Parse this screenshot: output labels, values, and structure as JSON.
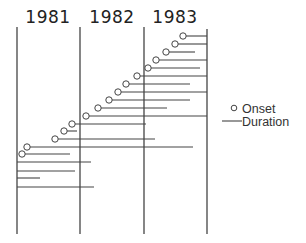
{
  "chart_data": {
    "type": "timeline",
    "title": "",
    "years": [
      "1981",
      "1982",
      "1983"
    ],
    "x_axis": {
      "unit": "year",
      "range": [
        1981.0,
        1984.0
      ],
      "boundaries": [
        1981,
        1982,
        1983,
        1984
      ],
      "pixel_boundaries": [
        17,
        80,
        144,
        207
      ]
    },
    "grid": false,
    "legend": {
      "position": "right",
      "entries": [
        {
          "symbol": "circle",
          "label": "Onset"
        },
        {
          "symbol": "line",
          "label": "Duration"
        }
      ]
    },
    "rows": [
      {
        "y": 36,
        "onset_px": 183,
        "end_px": 207,
        "has_onset": true
      },
      {
        "y": 44,
        "onset_px": 175,
        "end_px": 207,
        "has_onset": true
      },
      {
        "y": 52,
        "onset_px": 166,
        "end_px": 195,
        "has_onset": true
      },
      {
        "y": 60,
        "onset_px": 156,
        "end_px": 207,
        "has_onset": true
      },
      {
        "y": 68,
        "onset_px": 148,
        "end_px": 200,
        "has_onset": true
      },
      {
        "y": 76,
        "onset_px": 137,
        "end_px": 207,
        "has_onset": true
      },
      {
        "y": 84,
        "onset_px": 126,
        "end_px": 190,
        "has_onset": true
      },
      {
        "y": 92,
        "onset_px": 118,
        "end_px": 207,
        "has_onset": true
      },
      {
        "y": 100,
        "onset_px": 109,
        "end_px": 190,
        "has_onset": true
      },
      {
        "y": 108,
        "onset_px": 98,
        "end_px": 167,
        "has_onset": true
      },
      {
        "y": 116,
        "onset_px": 86,
        "end_px": 207,
        "has_onset": true
      },
      {
        "y": 124,
        "onset_px": 72,
        "end_px": 146,
        "has_onset": true
      },
      {
        "y": 131,
        "onset_px": 64,
        "end_px": 77,
        "has_onset": true
      },
      {
        "y": 139,
        "onset_px": 55,
        "end_px": 155,
        "has_onset": true
      },
      {
        "y": 147,
        "onset_px": 27,
        "end_px": 193,
        "has_onset": true
      },
      {
        "y": 154,
        "onset_px": 22,
        "end_px": 70,
        "has_onset": true
      },
      {
        "y": 162,
        "onset_px": 17,
        "end_px": 91,
        "has_onset": false
      },
      {
        "y": 171,
        "onset_px": 17,
        "end_px": 75,
        "has_onset": false
      },
      {
        "y": 178,
        "onset_px": 17,
        "end_px": 40,
        "has_onset": false
      },
      {
        "y": 187,
        "onset_px": 17,
        "end_px": 94,
        "has_onset": false
      }
    ],
    "xlabel": "",
    "ylabel": ""
  },
  "labels": {
    "year_1981": "1981",
    "year_1982": "1982",
    "year_1983": "1983",
    "legend_onset": "Onset",
    "legend_duration": "Duration"
  }
}
